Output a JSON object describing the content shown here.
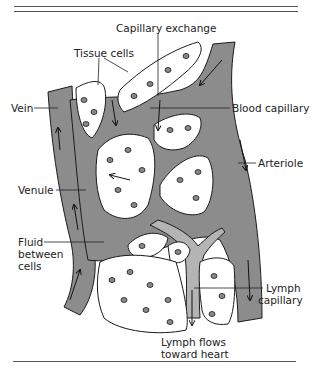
{
  "figure": {
    "type": "illustration",
    "colors": {
      "vessel": "#8c8c8c",
      "lymph": "#b4b4b4",
      "cell_fill": "#ffffff",
      "nucleus": "#8a8a8a",
      "outline": "#1a1a1a",
      "rule": "#555555",
      "text": "#222222"
    }
  },
  "labels": {
    "capillary_exchange": "Capillary exchange",
    "tissue_cells": "Tissue cells",
    "vein": "Vein",
    "blood_capillary": "Blood capillary",
    "arteriole": "Arteriole",
    "venule": "Venule",
    "fluid_line1": "Fluid",
    "fluid_line2": "between",
    "fluid_line3": "cells",
    "lymph_capillary_line1": "Lymph",
    "lymph_capillary_line2": "capillary",
    "lymph_flows_line1": "Lymph flows",
    "lymph_flows_line2": "toward heart"
  }
}
